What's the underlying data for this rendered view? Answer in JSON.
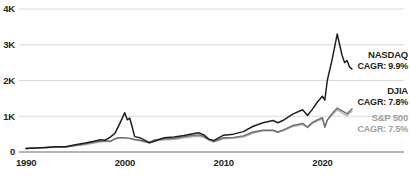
{
  "chart_data": {
    "type": "line",
    "title": "",
    "subtitle": "",
    "xlabel": "",
    "ylabel": "",
    "xlim": [
      1990,
      2023
    ],
    "ylim": [
      0,
      4000
    ],
    "grid": true,
    "legend_position": "right",
    "y_ticks": [
      {
        "value": 0,
        "label": "0"
      },
      {
        "value": 1000,
        "label": "1K"
      },
      {
        "value": 2000,
        "label": "2K"
      },
      {
        "value": 3000,
        "label": "3K"
      },
      {
        "value": 4000,
        "label": "4K"
      }
    ],
    "x_ticks": [
      {
        "value": 1990,
        "label": "1990"
      },
      {
        "value": 2000,
        "label": "2000"
      },
      {
        "value": 2010,
        "label": "2010"
      },
      {
        "value": 2020,
        "label": "2020"
      }
    ],
    "series": [
      {
        "name": "NASDAQ",
        "cagr_label": "CAGR: 9.9%",
        "color": "#231f20",
        "width": 1.5,
        "x": [
          1990,
          1991,
          1992,
          1993,
          1994,
          1995,
          1996,
          1997,
          1997.5,
          1998,
          1998.5,
          1999,
          1999.5,
          2000,
          2000.25,
          2000.5,
          2000.75,
          2001,
          2001.5,
          2002,
          2002.5,
          2003,
          2004,
          2005,
          2006,
          2007,
          2007.5,
          2008,
          2008.5,
          2009,
          2010,
          2011,
          2012,
          2013,
          2014,
          2015,
          2015.5,
          2016,
          2017,
          2018,
          2018.5,
          2019,
          2019.5,
          2020,
          2020.25,
          2020.5,
          2021,
          2021.5,
          2022,
          2022.25,
          2022.5,
          2022.75,
          2023
        ],
        "values": [
          100,
          110,
          128,
          147,
          144,
          204,
          251,
          308,
          340,
          329,
          410,
          520,
          800,
          1100,
          900,
          950,
          700,
          430,
          400,
          330,
          260,
          300,
          400,
          420,
          460,
          520,
          540,
          480,
          360,
          320,
          470,
          500,
          570,
          720,
          820,
          880,
          820,
          880,
          1060,
          1180,
          1020,
          1200,
          1400,
          1560,
          1450,
          2000,
          2600,
          3300,
          2700,
          2500,
          2560,
          2380,
          2320
        ]
      },
      {
        "name": "DJIA",
        "cagr_label": "CAGR: 7.8%",
        "color": "#6d6d6d",
        "width": 1.4,
        "x": [
          1990,
          1991,
          1992,
          1993,
          1994,
          1995,
          1996,
          1997,
          1997.5,
          1998,
          1998.5,
          1999,
          1999.5,
          2000,
          2000.5,
          2001,
          2001.5,
          2002,
          2002.5,
          2003,
          2004,
          2005,
          2006,
          2007,
          2007.5,
          2008,
          2008.5,
          2009,
          2010,
          2011,
          2012,
          2013,
          2014,
          2015,
          2015.5,
          2016,
          2017,
          2018,
          2018.5,
          2019,
          2019.5,
          2020,
          2020.25,
          2020.5,
          2021,
          2021.5,
          2022,
          2022.5,
          2023
        ],
        "values": [
          100,
          118,
          126,
          143,
          143,
          185,
          228,
          282,
          300,
          310,
          300,
          370,
          400,
          395,
          380,
          350,
          330,
          300,
          270,
          340,
          370,
          380,
          430,
          470,
          480,
          440,
          360,
          300,
          400,
          410,
          450,
          560,
          610,
          610,
          560,
          610,
          740,
          800,
          700,
          830,
          900,
          960,
          700,
          900,
          1080,
          1230,
          1150,
          1070,
          1200
        ]
      },
      {
        "name": "S&P 500",
        "cagr_label": "CAGR: 7.5%",
        "color": "#b0b0b0",
        "width": 1.4,
        "x": [
          1990,
          1991,
          1992,
          1993,
          1994,
          1995,
          1996,
          1997,
          1997.5,
          1998,
          1998.5,
          1999,
          1999.5,
          2000,
          2000.5,
          2001,
          2001.5,
          2002,
          2002.5,
          2003,
          2004,
          2005,
          2006,
          2007,
          2007.5,
          2008,
          2008.5,
          2009,
          2010,
          2011,
          2012,
          2013,
          2014,
          2015,
          2015.5,
          2016,
          2017,
          2018,
          2018.5,
          2019,
          2019.5,
          2020,
          2020.25,
          2020.5,
          2021,
          2021.5,
          2022,
          2022.5,
          2023
        ],
        "values": [
          100,
          115,
          120,
          130,
          128,
          170,
          203,
          260,
          280,
          300,
          290,
          370,
          400,
          395,
          375,
          340,
          320,
          280,
          250,
          310,
          340,
          350,
          400,
          430,
          440,
          410,
          330,
          280,
          370,
          380,
          420,
          530,
          590,
          590,
          550,
          590,
          710,
          770,
          680,
          800,
          870,
          930,
          690,
          880,
          1040,
          1180,
          1090,
          1020,
          1140
        ]
      }
    ]
  }
}
